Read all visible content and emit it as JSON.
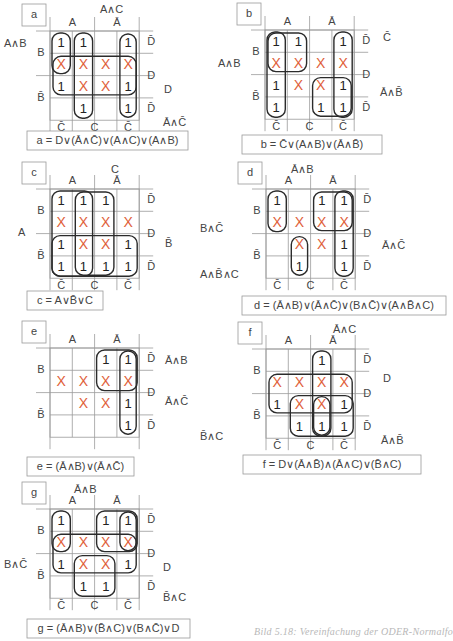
{
  "colors": {
    "grid": "#9a9a9a",
    "loop": "#2b2b2b",
    "one": "#222222",
    "dontcare": "#e0603a",
    "text": "#444444"
  },
  "labels": {
    "A": "A",
    "Abar": "Ā",
    "B": "B",
    "Bbar": "B̄",
    "C": "C",
    "Cbar": "C̄",
    "D": "D",
    "Dbar": "D̄"
  },
  "maps": [
    {
      "id": "a",
      "origin": [
        50,
        31
      ],
      "cells": [
        [
          "1",
          "1",
          "",
          "1"
        ],
        [
          "X",
          "X",
          "X",
          "X"
        ],
        [
          "1",
          "X",
          "X",
          "1"
        ],
        [
          "",
          "1",
          "",
          "1"
        ]
      ],
      "show_c_labels": true,
      "loops": [
        [
          0,
          0,
          1,
          3
        ],
        [
          1,
          0,
          3,
          1
        ],
        [
          0,
          1,
          1,
          4
        ],
        [
          0,
          3,
          1,
          4
        ]
      ],
      "loops_comment": "row0,col0,row1,col1 exclusive-ish boxes",
      "terms": [
        {
          "text": "A∧B",
          "x": 4,
          "y": 44
        },
        {
          "text": "A∧C",
          "x": 100,
          "y": 10
        },
        {
          "text": "D",
          "x": 164,
          "y": 90
        },
        {
          "text": "Ā∧C̄",
          "x": 163,
          "y": 123
        }
      ],
      "equation": "a = D∨(Ā∧C̄)∨(A∧C)∨(A∧B)",
      "eq_box": [
        27,
        131,
        161,
        19
      ]
    },
    {
      "id": "b",
      "origin": [
        265,
        30
      ],
      "cells": [
        [
          "1",
          "1",
          "",
          "1"
        ],
        [
          "X",
          "X",
          "X",
          "X"
        ],
        [
          "1",
          "X",
          "X",
          "1"
        ],
        [
          "1",
          "",
          "1",
          "1"
        ]
      ],
      "show_c_labels": true,
      "terms": [
        {
          "text": "C̄",
          "x": 383,
          "y": 38
        },
        {
          "text": "A∧B",
          "x": 218,
          "y": 64
        },
        {
          "text": "Ā∧B̄",
          "x": 380,
          "y": 93
        }
      ],
      "equation": "b = C̄∨(A∧B)∨(Ā∧B̄)",
      "eq_box": [
        242,
        135,
        140,
        19
      ]
    },
    {
      "id": "c",
      "origin": [
        50,
        189
      ],
      "cells": [
        [
          "1",
          "1",
          "1",
          ""
        ],
        [
          "X",
          "X",
          "X",
          "X"
        ],
        [
          "1",
          "X",
          "X",
          "1"
        ],
        [
          "1",
          "1",
          "1",
          "1"
        ]
      ],
      "show_c_labels": true,
      "terms": [
        {
          "text": "C",
          "x": 111,
          "y": 170
        },
        {
          "text": "A",
          "x": 18,
          "y": 233
        },
        {
          "text": "B̄",
          "x": 165,
          "y": 244
        }
      ],
      "equation": "c = A∨B̄∨C",
      "eq_box": [
        27,
        291,
        76,
        19
      ]
    },
    {
      "id": "d",
      "origin": [
        266,
        189
      ],
      "cells": [
        [
          "1",
          "",
          "1",
          "1"
        ],
        [
          "X",
          "X",
          "X",
          "X"
        ],
        [
          "",
          "X",
          "X",
          "1"
        ],
        [
          "",
          "1",
          "",
          "1"
        ]
      ],
      "show_c_labels": true,
      "terms": [
        {
          "text": "Ā∧B",
          "x": 291,
          "y": 170
        },
        {
          "text": "B∧C̄",
          "x": 200,
          "y": 229
        },
        {
          "text": "Ā∧C̄",
          "x": 382,
          "y": 246
        },
        {
          "text": "A∧B̄∧C",
          "x": 200,
          "y": 275
        }
      ],
      "equation": "d = (Ā∧B)∨(Ā∧C̄)∨(B∧C̄)∨(A∧B̄∧C)",
      "eq_box": [
        242,
        296,
        204,
        19
      ]
    },
    {
      "id": "e",
      "origin": [
        50,
        348
      ],
      "cells": [
        [
          "",
          "",
          "1",
          "1"
        ],
        [
          "X",
          "X",
          "X",
          "X"
        ],
        [
          "",
          "X",
          "X",
          "1"
        ],
        [
          "",
          "",
          "",
          "1"
        ]
      ],
      "show_c_labels": false,
      "terms": [
        {
          "text": "Ā∧B",
          "x": 165,
          "y": 361
        },
        {
          "text": "Ā∧C̄",
          "x": 165,
          "y": 402
        }
      ],
      "equation": "e = (Ā∧B)∨(Ā∧C̄)",
      "eq_box": [
        27,
        457,
        107,
        19
      ]
    },
    {
      "id": "f",
      "origin": [
        266,
        349
      ],
      "cells": [
        [
          "",
          "",
          "1",
          ""
        ],
        [
          "X",
          "X",
          "X",
          "X"
        ],
        [
          "1",
          "X",
          "X",
          "1"
        ],
        [
          "",
          "1",
          "1",
          "1"
        ]
      ],
      "show_c_labels": true,
      "terms": [
        {
          "text": "Ā∧C",
          "x": 333,
          "y": 330
        },
        {
          "text": "D",
          "x": 383,
          "y": 379
        },
        {
          "text": "B̄∧C",
          "x": 200,
          "y": 437
        },
        {
          "text": "Ā∧B̄",
          "x": 381,
          "y": 441
        }
      ],
      "equation": "f = D∨(Ā∧B̄)∧(Ā∧C)∨(B̄∧C)",
      "eq_box": [
        243,
        455,
        178,
        19
      ]
    },
    {
      "id": "g",
      "origin": [
        50,
        509
      ],
      "cells": [
        [
          "1",
          "",
          "1",
          "1"
        ],
        [
          "X",
          "X",
          "X",
          "X"
        ],
        [
          "1",
          "X",
          "X",
          "1"
        ],
        [
          "",
          "1",
          "1",
          ""
        ]
      ],
      "show_c_labels": true,
      "terms": [
        {
          "text": "Ā∧B",
          "x": 74,
          "y": 490
        },
        {
          "text": "B∧C̄",
          "x": 4,
          "y": 565
        },
        {
          "text": "D",
          "x": 163,
          "y": 568
        },
        {
          "text": "B̄∧C",
          "x": 163,
          "y": 598
        }
      ],
      "equation": "g = (Ā∧B)∨(B̄∧C)∨(B∧C̄)∨D",
      "eq_box": [
        27,
        619,
        163,
        19
      ]
    }
  ],
  "figure_caption": "Bild 5.18: Vereinfachung der ODER-Normalfo"
}
